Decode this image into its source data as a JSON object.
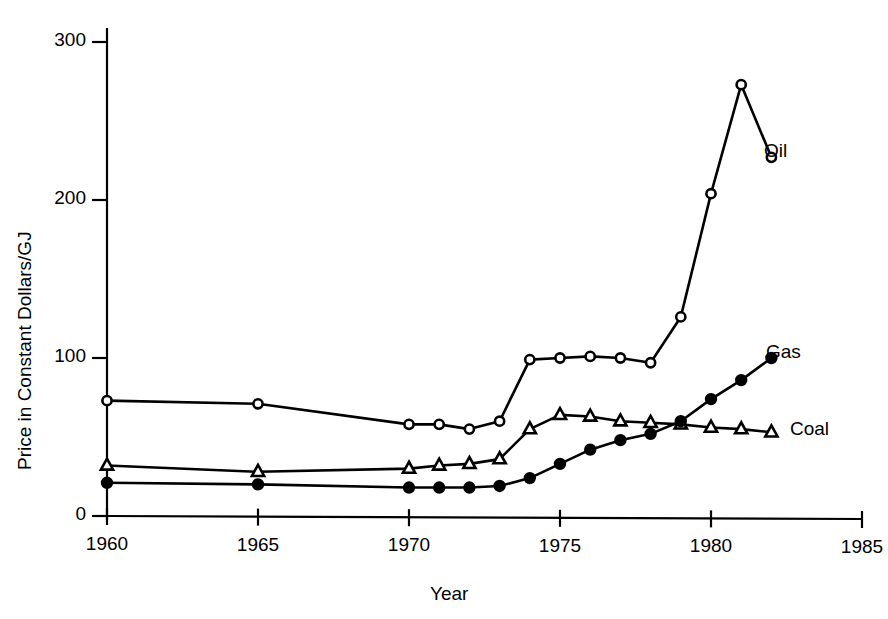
{
  "chart_data": {
    "type": "line",
    "title": "",
    "xlabel": "Year",
    "ylabel": "Price in Constant Dollars/GJ",
    "xlim": [
      1960,
      1985
    ],
    "ylim": [
      0,
      300
    ],
    "xticks": [
      "1960",
      "1965",
      "1970",
      "1975",
      "1980",
      "1985"
    ],
    "xtick_values": [
      1960,
      1965,
      1970,
      1975,
      1980,
      1985
    ],
    "yticks": [
      "0",
      "100",
      "200",
      "300"
    ],
    "ytick_values": [
      0,
      100,
      200,
      300
    ],
    "grid": false,
    "legend_position": "inline-right-of-series",
    "series": [
      {
        "name": "Oil",
        "marker": "open-circle",
        "label": "Oil",
        "x": [
          1960,
          1965,
          1970,
          1971,
          1972,
          1973,
          1974,
          1975,
          1976,
          1977,
          1978,
          1979,
          1980,
          1981,
          1982
        ],
        "values": [
          73,
          71,
          58,
          58,
          55,
          60,
          99,
          100,
          101,
          100,
          97,
          126,
          204,
          273,
          227
        ]
      },
      {
        "name": "Coal",
        "marker": "open-triangle",
        "label": "Coal",
        "x": [
          1960,
          1965,
          1970,
          1971,
          1972,
          1973,
          1974,
          1975,
          1976,
          1977,
          1978,
          1979,
          1980,
          1981,
          1982
        ],
        "values": [
          32,
          28,
          30,
          32,
          33,
          36,
          55,
          64,
          63,
          60,
          59,
          58,
          56,
          55,
          53
        ]
      },
      {
        "name": "Gas",
        "marker": "filled-circle",
        "label": "Gas",
        "x": [
          1960,
          1965,
          1970,
          1971,
          1972,
          1973,
          1974,
          1975,
          1976,
          1977,
          1978,
          1979,
          1980,
          1981,
          1982
        ],
        "values": [
          21,
          20,
          18,
          18,
          18,
          19,
          24,
          33,
          42,
          48,
          52,
          60,
          74,
          86,
          100
        ]
      }
    ]
  },
  "axes": {
    "ylabel": "Price in Constant Dollars/GJ",
    "xlabel": "Year"
  },
  "labels": {
    "oil": "Oil",
    "gas": "Gas",
    "coal": "Coal"
  },
  "colors": {
    "line": "#000000",
    "background": "#ffffff",
    "marker_fill_open": "#ffffff",
    "marker_fill_solid": "#000000"
  }
}
